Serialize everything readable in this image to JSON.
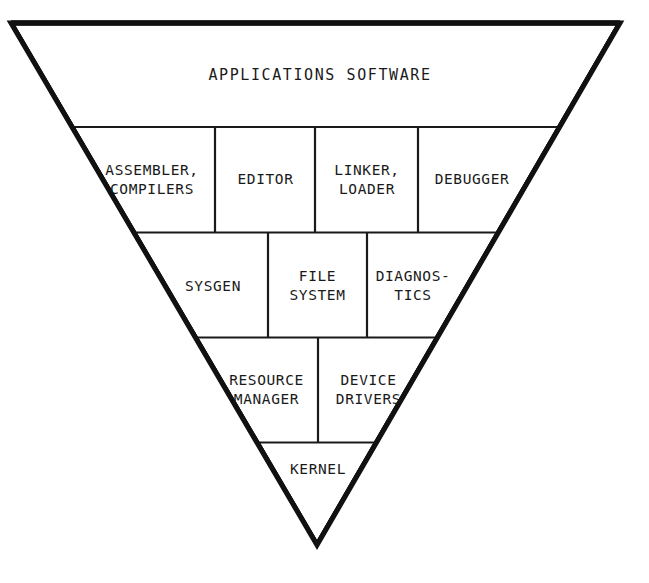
{
  "diagram": {
    "kind": "inverted-pyramid",
    "title": "",
    "stroke_color": "#111111",
    "thin_stroke_color": "#1a1a1a",
    "background_color": "#ffffff",
    "outline_width": 5,
    "divider_width": 2,
    "apex": {
      "x": 317,
      "y": 545
    },
    "top_left": {
      "x": 11,
      "y": 23
    },
    "top_right": {
      "x": 620,
      "y": 23
    },
    "row_boundaries": [
      23,
      127,
      232.5,
      337.5,
      442.5,
      545
    ],
    "layers": [
      {
        "id": "applications",
        "level": 1,
        "cells": [
          {
            "id": "applications-software",
            "lines": [
              "APPLICATIONS SOFTWARE"
            ]
          }
        ]
      },
      {
        "id": "development-tools",
        "level": 2,
        "dividers_x": [
          215,
          315,
          418
        ],
        "cells": [
          {
            "id": "assembler-compilers",
            "lines": [
              "ASSEMBLER,",
              "COMPILERS"
            ]
          },
          {
            "id": "editor",
            "lines": [
              "EDITOR"
            ]
          },
          {
            "id": "linker-loader",
            "lines": [
              "LINKER,",
              "LOADER"
            ]
          },
          {
            "id": "debugger",
            "lines": [
              "DEBUGGER"
            ]
          }
        ]
      },
      {
        "id": "system-services",
        "level": 3,
        "dividers_x": [
          268,
          367
        ],
        "cells": [
          {
            "id": "sysgen",
            "lines": [
              "SYSGEN"
            ]
          },
          {
            "id": "file-system",
            "lines": [
              "FILE",
              "SYSTEM"
            ]
          },
          {
            "id": "diagnostics",
            "lines": [
              "DIAGNOS-",
              "TICS"
            ]
          }
        ]
      },
      {
        "id": "resource-device",
        "level": 4,
        "dividers_x": [
          318
        ],
        "cells": [
          {
            "id": "resource-manager",
            "lines": [
              "RESOURCE",
              "MANAGER"
            ]
          },
          {
            "id": "device-drivers",
            "lines": [
              "DEVICE",
              "DRIVERS"
            ]
          }
        ]
      },
      {
        "id": "kernel",
        "level": 5,
        "dividers_x": [],
        "cells": [
          {
            "id": "kernel",
            "lines": [
              "KERNEL"
            ]
          }
        ]
      }
    ]
  },
  "labels": {
    "applications_software": "APPLICATIONS SOFTWARE",
    "assembler": "ASSEMBLER,",
    "compilers": "COMPILERS",
    "editor": "EDITOR",
    "linker": "LINKER,",
    "loader": "LOADER",
    "debugger": "DEBUGGER",
    "sysgen": "SYSGEN",
    "file": "FILE",
    "system": "SYSTEM",
    "diagnos": "DIAGNOS-",
    "tics": "TICS",
    "resource": "RESOURCE",
    "manager": "MANAGER",
    "device": "DEVICE",
    "drivers": "DRIVERS",
    "kernel": "KERNEL"
  }
}
